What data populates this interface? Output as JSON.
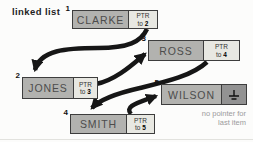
{
  "title": "linked list",
  "note": {
    "line1": "no pointer for",
    "line2": "last item"
  },
  "nodes": [
    {
      "index": "1",
      "name": "CLARKE",
      "ptr_label": "PTR",
      "ptr_prefix": "to",
      "ptr_target": "2"
    },
    {
      "index": "2",
      "name": "JONES",
      "ptr_label": "PTR",
      "ptr_prefix": "to",
      "ptr_target": "3"
    },
    {
      "index": "3",
      "name": "ROSS",
      "ptr_label": "PTR",
      "ptr_prefix": "to",
      "ptr_target": "4"
    },
    {
      "index": "4",
      "name": "SMITH",
      "ptr_label": "PTR",
      "ptr_prefix": "to",
      "ptr_target": "5"
    },
    {
      "index": "5",
      "name": "WILSON",
      "null_icon": "ground-null-symbol"
    }
  ],
  "arrows": [
    {
      "from": "1",
      "to": "2"
    },
    {
      "from": "2",
      "to": "3"
    },
    {
      "from": "3",
      "to": "4"
    },
    {
      "from": "4",
      "to": "5"
    }
  ],
  "colors": {
    "name_cell": "#b2b2af",
    "pointer_cell": "#e8e8e2",
    "null_cell": "#929292",
    "border": "#3d3d3d",
    "arrow": "#161616",
    "note_text": "#9b9b9b",
    "background": "#fcfcfb"
  }
}
